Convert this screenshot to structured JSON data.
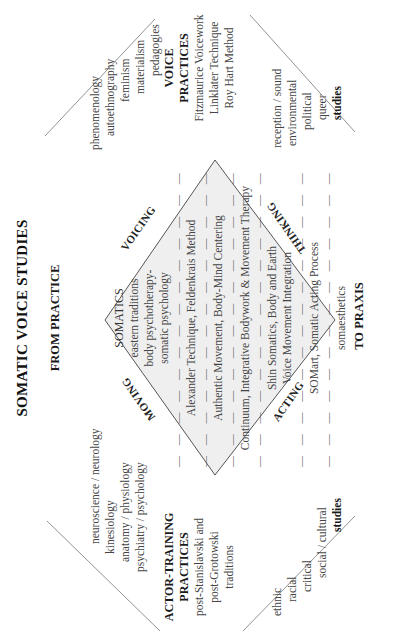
{
  "title": "SOMATIC VOICE STUDIES",
  "from_label": "FROM PRACTICE",
  "to_label": "TO PRAXIS",
  "quadrants": {
    "top_left": "MOVING",
    "top_right": "VOICING",
    "bottom_left": "ACTING",
    "bottom_right": "THINKING"
  },
  "diamond": {
    "heading": "SOMATICS",
    "lines": [
      "eastern traditions",
      "body psychotherapy-",
      "somatic psychology"
    ],
    "practices": [
      "Alexander Technique, Feldenkrais Method",
      "Authentic Movement, Body-Mind Centering",
      "Continuum, Integrative Bodywork & Movement Therapy",
      "Shin Somatics, Body and Earth",
      "Voice Movement Integration",
      "SOMart, Somatic Acting Process",
      "somaesthetics"
    ],
    "dashes": "— — — — — — — — — — — — — —",
    "fill_color": "#efefef",
    "edge_color": "#555555"
  },
  "left_top": {
    "items": [
      "neuroscience / neurology",
      "kinesiology",
      "anatomy / physiology",
      "psychiatry / psychology"
    ]
  },
  "right_top": {
    "items": [
      "phenomenology",
      "autoethnography",
      "feminism",
      "materialism",
      "pedagogies"
    ]
  },
  "actor_training": {
    "heading1": "ACTOR-TRAINING",
    "heading2": "PRACTICES",
    "items": [
      "post-Stanislavski and",
      "post-Grotowski",
      "traditions"
    ]
  },
  "voice_practices": {
    "heading1": "VOICE",
    "heading2": "PRACTICES",
    "items": [
      "Fitzmaurice Voicework",
      "Linklater Technique",
      "Roy Hart Method"
    ]
  },
  "left_bottom": {
    "items": [
      "ethnic",
      "racial",
      "critical",
      "social / cultural"
    ],
    "footer": "studies"
  },
  "right_bottom": {
    "items": [
      "reception / sound",
      "environmental",
      "political",
      "queer"
    ],
    "footer": "studies"
  }
}
